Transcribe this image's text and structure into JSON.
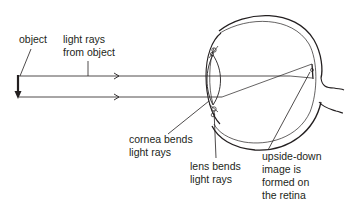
{
  "diagram": {
    "labels": {
      "object": "object",
      "light_rays_1": "light rays",
      "light_rays_2": "from object",
      "cornea_1": "cornea bends",
      "cornea_2": "light rays",
      "lens_1": "lens bends",
      "lens_2": "light rays",
      "image_1": "upside-down",
      "image_2": "image is",
      "image_3": "formed on",
      "image_4": "the retina"
    },
    "colors": {
      "ink": "#231f20",
      "background": "#ffffff"
    }
  }
}
